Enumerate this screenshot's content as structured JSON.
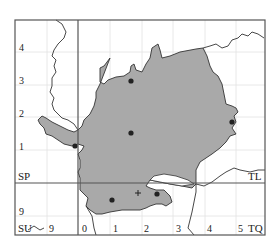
{
  "map": {
    "fill_color": "#a9a9a9",
    "stroke_color": "#333333",
    "grid_color": "#dcdcdc",
    "frame_color": "#555555",
    "square_labels": {
      "top_left": "SP",
      "top_right": "TL",
      "bottom_left": "SU",
      "bottom_right": "TQ"
    },
    "left_axis": [
      "4",
      "3",
      "2",
      "1",
      "9"
    ],
    "bottom_axis": [
      "9",
      "0",
      "1",
      "2",
      "3",
      "4",
      "5"
    ],
    "records": {
      "dots": 6,
      "crosses": 1
    }
  }
}
